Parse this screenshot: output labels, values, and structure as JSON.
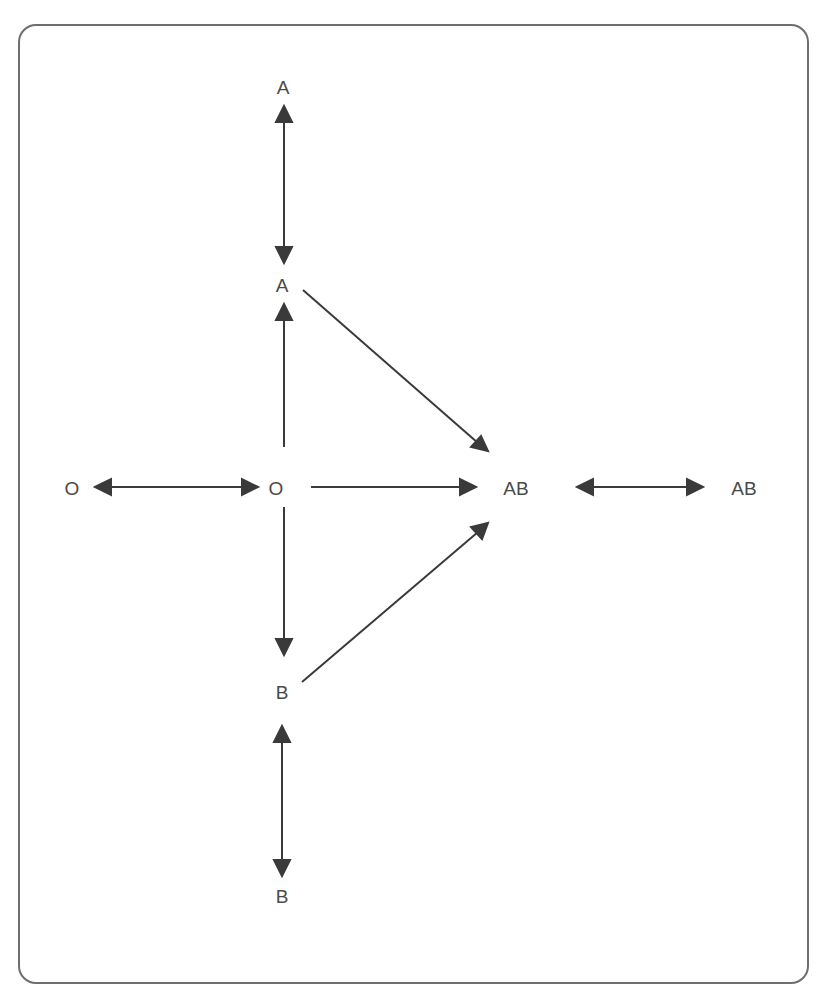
{
  "diagram": {
    "type": "blood-type-compatibility",
    "colors": {
      "frame": "#6e6e6e",
      "edge": "#3a3a3a",
      "text": "#4a4a4a"
    },
    "nodes": [
      {
        "id": "a_top",
        "label": "A",
        "x": 283,
        "y": 87
      },
      {
        "id": "a_mid",
        "label": "A",
        "x": 283,
        "y": 285
      },
      {
        "id": "o_left",
        "label": "O",
        "x": 72,
        "y": 488
      },
      {
        "id": "o_center",
        "label": "O",
        "x": 276,
        "y": 488
      },
      {
        "id": "ab_center",
        "label": "AB",
        "x": 515,
        "y": 488
      },
      {
        "id": "ab_right",
        "label": "AB",
        "x": 744,
        "y": 488
      },
      {
        "id": "b_mid",
        "label": "B",
        "x": 282,
        "y": 692
      },
      {
        "id": "b_bottom",
        "label": "B",
        "x": 282,
        "y": 896
      }
    ],
    "edges": [
      {
        "from": "a_top",
        "to": "a_mid",
        "direction": "both"
      },
      {
        "from": "o_center",
        "to": "a_mid",
        "direction": "forward"
      },
      {
        "from": "a_mid",
        "to": "ab_center",
        "direction": "forward"
      },
      {
        "from": "o_left",
        "to": "o_center",
        "direction": "both"
      },
      {
        "from": "o_center",
        "to": "ab_center",
        "direction": "forward"
      },
      {
        "from": "ab_center",
        "to": "ab_right",
        "direction": "both"
      },
      {
        "from": "o_center",
        "to": "b_mid",
        "direction": "forward"
      },
      {
        "from": "b_mid",
        "to": "ab_center",
        "direction": "forward"
      },
      {
        "from": "b_mid",
        "to": "b_bottom",
        "direction": "both"
      }
    ]
  }
}
